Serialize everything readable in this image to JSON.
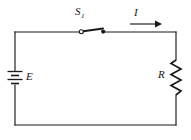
{
  "figure": {
    "name": "simple-series-circuit",
    "stroke_color": "#1a1a1a",
    "background_color": "#ffffff"
  },
  "labels": {
    "switch": "S",
    "switch_subscript": "1",
    "current": "I",
    "emf": "E",
    "resistance": "R"
  },
  "components": [
    {
      "name": "battery",
      "symbol": "battery-cell",
      "label": "E",
      "position": "left-branch"
    },
    {
      "name": "switch",
      "symbol": "spst-switch-open",
      "label": "S1",
      "position": "top-branch"
    },
    {
      "name": "resistor",
      "symbol": "zigzag-resistor",
      "label": "R",
      "position": "right-branch"
    },
    {
      "name": "current-arrow",
      "symbol": "arrow-right",
      "label": "I",
      "position": "top-branch"
    }
  ],
  "circuit_geometry": {
    "left_x": 15,
    "right_x": 176,
    "top_y": 32,
    "bottom_y": 125
  }
}
